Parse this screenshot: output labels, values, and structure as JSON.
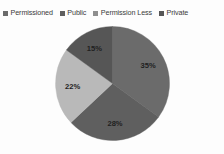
{
  "chart_data": {
    "type": "pie",
    "title": "",
    "subtitle": "",
    "xlabel": "",
    "ylabel": "",
    "grid": false,
    "legend_position": "top",
    "units": "percent",
    "categories": [
      "Permissioned",
      "Public",
      "Permission Less",
      "Private"
    ],
    "values": [
      35,
      28,
      22,
      15
    ],
    "slices": [
      {
        "label": "Permissioned",
        "value": 35,
        "display": "35%",
        "color": "#6b6b6b",
        "start_angle": 0,
        "end_angle": 126
      },
      {
        "label": "Public",
        "value": 28,
        "display": "28%",
        "color": "#5f5f5f",
        "start_angle": 126,
        "end_angle": 226.8
      },
      {
        "label": "Permission Less",
        "value": 22,
        "display": "22%",
        "color": "#b9b9b9",
        "start_angle": 226.8,
        "end_angle": 306
      },
      {
        "label": "Private",
        "value": 15,
        "display": "15%",
        "color": "#565656",
        "start_angle": 306,
        "end_angle": 360
      }
    ],
    "data_labels": [
      "35%",
      "28%",
      "22%",
      "15%"
    ]
  },
  "legend": {
    "items": [
      {
        "label": "Permissioned",
        "color": "#6b6b6b"
      },
      {
        "label": "Public",
        "color": "#5f5f5f"
      },
      {
        "label": "Permission Less",
        "color": "#8f8f8f"
      },
      {
        "label": "Private",
        "color": "#565656"
      }
    ]
  },
  "colors": {
    "background": "#fdfdfd",
    "label_text": "#1f1f1f",
    "legend_text": "#3a3a3a",
    "slice_permissioned": "#6b6b6b",
    "slice_public": "#5f5f5f",
    "slice_permission_less": "#b9b9b9",
    "slice_private": "#565656"
  }
}
